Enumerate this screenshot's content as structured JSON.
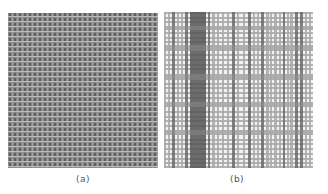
{
  "figure": {
    "panels": [
      {
        "id": "a",
        "label": "(a)",
        "description": "fine regular woven pattern",
        "period": 5,
        "colors": {
          "base": "#8a8a8a",
          "warp": "#5e5e5e",
          "weft": "#bdbdbd"
        }
      },
      {
        "id": "b",
        "label": "(b)",
        "description": "irregular plaid weave pattern",
        "colors": {
          "light": "#f2f2f2",
          "mid": "#a8a8a8",
          "dark": "#6a6a6a",
          "darkest": "#555555"
        },
        "vertical_stripes": [
          [
            0,
            2,
            "mid"
          ],
          [
            4,
            2,
            "mid"
          ],
          [
            8,
            3,
            "dark"
          ],
          [
            13,
            2,
            "mid"
          ],
          [
            17,
            2,
            "mid"
          ],
          [
            21,
            3,
            "dark"
          ],
          [
            26,
            16,
            "darkest"
          ],
          [
            44,
            2,
            "dark"
          ],
          [
            48,
            3,
            "mid"
          ],
          [
            53,
            2,
            "mid"
          ],
          [
            58,
            2,
            "mid"
          ],
          [
            63,
            2,
            "mid"
          ],
          [
            68,
            3,
            "dark"
          ],
          [
            73,
            2,
            "mid"
          ],
          [
            79,
            2,
            "mid"
          ],
          [
            84,
            3,
            "dark"
          ],
          [
            89,
            2,
            "mid"
          ],
          [
            93,
            2,
            "mid"
          ],
          [
            97,
            3,
            "dark"
          ],
          [
            102,
            3,
            "mid"
          ],
          [
            106,
            2,
            "mid"
          ],
          [
            110,
            3,
            "mid"
          ],
          [
            115,
            2,
            "mid"
          ],
          [
            119,
            2,
            "dark"
          ],
          [
            123,
            2,
            "mid"
          ],
          [
            126,
            3,
            "mid"
          ],
          [
            131,
            3,
            "dark"
          ],
          [
            136,
            3,
            "dark"
          ],
          [
            141,
            2,
            "mid"
          ],
          [
            145,
            2,
            "mid"
          ]
        ],
        "horizontal_stripes": [
          [
            0,
            2,
            "mid"
          ],
          [
            5,
            2,
            "mid"
          ],
          [
            9,
            2,
            "mid"
          ],
          [
            14,
            4,
            "mid"
          ],
          [
            20,
            2,
            "mid"
          ],
          [
            25,
            2,
            "mid"
          ],
          [
            29,
            2,
            "mid"
          ],
          [
            33,
            6,
            "mid"
          ],
          [
            42,
            2,
            "mid"
          ],
          [
            47,
            2,
            "mid"
          ],
          [
            52,
            2,
            "mid"
          ],
          [
            56,
            2,
            "mid"
          ],
          [
            62,
            6,
            "mid"
          ],
          [
            71,
            2,
            "mid"
          ],
          [
            75,
            2,
            "mid"
          ],
          [
            80,
            2,
            "mid"
          ],
          [
            85,
            2,
            "mid"
          ],
          [
            90,
            5,
            "mid"
          ],
          [
            99,
            2,
            "mid"
          ],
          [
            104,
            2,
            "mid"
          ],
          [
            108,
            2,
            "mid"
          ],
          [
            113,
            2,
            "mid"
          ],
          [
            118,
            5,
            "mid"
          ],
          [
            127,
            2,
            "mid"
          ],
          [
            131,
            2,
            "mid"
          ],
          [
            136,
            2,
            "mid"
          ],
          [
            141,
            2,
            "mid"
          ],
          [
            146,
            2,
            "mid"
          ],
          [
            150,
            2,
            "mid"
          ],
          [
            154,
            2,
            "mid"
          ]
        ]
      }
    ]
  }
}
